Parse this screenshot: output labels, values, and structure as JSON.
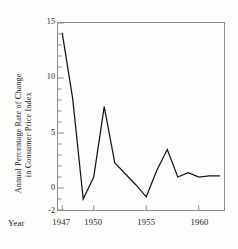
{
  "chart_data": {
    "type": "line",
    "title": "",
    "xlabel": "Year",
    "ylabel_line_1": "Annual Percentage Rate of Change",
    "ylabel_line_2": "in Consumer Price Index",
    "xlim": [
      1946.6,
      1962.4
    ],
    "ylim": [
      -2,
      15
    ],
    "grid": false,
    "legend": "none",
    "yticks": [
      {
        "value": 15,
        "label": "15"
      },
      {
        "value": 10,
        "label": "10"
      },
      {
        "value": 5,
        "label": "5"
      },
      {
        "value": 0,
        "label": "0"
      },
      {
        "value": -2,
        "label": "-2"
      }
    ],
    "y_minor_tick_step": 1,
    "xticks": [
      {
        "value": 1947,
        "label": "1947"
      },
      {
        "value": 1950,
        "label": "1950"
      },
      {
        "value": 1955,
        "label": "1955"
      },
      {
        "value": 1960,
        "label": "1960"
      }
    ],
    "x": [
      1947,
      1948,
      1949,
      1950,
      1951,
      1952,
      1953,
      1954,
      1955,
      1956,
      1957,
      1958,
      1959,
      1960,
      1961,
      1962
    ],
    "series": [
      {
        "name": "Annual percentage rate of change in consumer price index",
        "color": "#141414",
        "values": [
          14.1,
          8.1,
          -1.0,
          1.0,
          7.4,
          2.3,
          1.3,
          0.3,
          -0.8,
          1.6,
          3.5,
          1.0,
          1.4,
          1.0,
          1.1,
          1.1
        ]
      }
    ]
  },
  "colors": {
    "line": "#141414",
    "axis": "#8d8d8d",
    "text": "#232323",
    "background": "#fdfdfb"
  }
}
